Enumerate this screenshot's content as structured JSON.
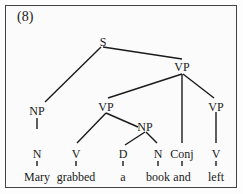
{
  "example_number": "(8)",
  "nodes": {
    "s": "S",
    "vp_top": "VP",
    "np_subj": "NP",
    "vp_left": "VP",
    "vp_right": "VP",
    "np_obj": "NP",
    "n_subj": "N",
    "v_left": "V",
    "d": "D",
    "n_obj": "N",
    "conj": "Conj",
    "v_right": "V"
  },
  "words": {
    "w1": "Mary",
    "w2": "grabbed",
    "w3": "a",
    "w4": "book",
    "w5": "and",
    "w6": "left"
  }
}
